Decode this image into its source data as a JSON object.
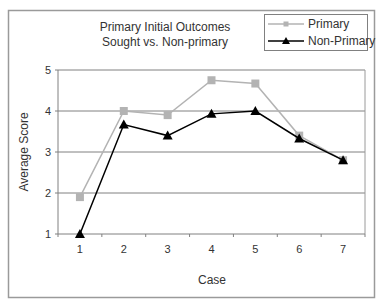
{
  "chart_data": {
    "type": "line",
    "title_lines": [
      "Primary Initial Outcomes",
      "Sought vs. Non-primary"
    ],
    "xlabel": "Case",
    "ylabel": "Average Score",
    "categories": [
      "1",
      "2",
      "3",
      "4",
      "5",
      "6",
      "7"
    ],
    "x": [
      1,
      2,
      3,
      4,
      5,
      6,
      7
    ],
    "yticks": [
      1,
      2,
      3,
      4,
      5
    ],
    "ylim": [
      1,
      5
    ],
    "grid": true,
    "legend_position": "top-right",
    "series": [
      {
        "name": "Primary",
        "color": "#b3b3b3",
        "marker": "square",
        "values": [
          1.9,
          4.0,
          3.9,
          4.75,
          4.67,
          3.4,
          2.8
        ]
      },
      {
        "name": "Non-Primary",
        "color": "#000000",
        "marker": "triangle",
        "values": [
          1.0,
          3.67,
          3.4,
          3.93,
          4.0,
          3.33,
          2.8
        ]
      }
    ]
  }
}
